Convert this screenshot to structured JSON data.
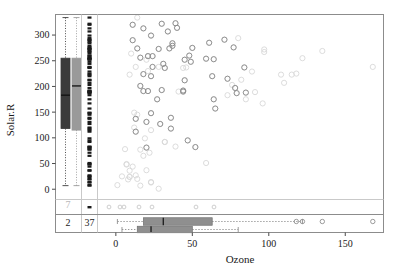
{
  "chart_data": {
    "type": "scatter",
    "title": "",
    "xlabel": "Ozone",
    "ylabel": "Solar.R",
    "xlim": [
      -12,
      175
    ],
    "ylim": [
      -20,
      340
    ],
    "xticks": [
      0,
      50,
      100,
      150
    ],
    "yticks": [
      0,
      50,
      100,
      150,
      200,
      250,
      300
    ],
    "grid": false,
    "legend": null,
    "series": [
      {
        "name": "observed-points",
        "color": "#d8d8d8",
        "marker": "open-circle",
        "points": [
          [
            41,
            190
          ],
          [
            36,
            118
          ],
          [
            12,
            149
          ],
          [
            18,
            313
          ],
          [
            28,
            1
          ],
          [
            23,
            299
          ],
          [
            19,
            99
          ],
          [
            8,
            19
          ],
          [
            16,
            256
          ],
          [
            11,
            290
          ],
          [
            14,
            274
          ],
          [
            18,
            65
          ],
          [
            14,
            334
          ],
          [
            34,
            307
          ],
          [
            6,
            78
          ],
          [
            30,
            322
          ],
          [
            11,
            44
          ],
          [
            1,
            8
          ],
          [
            11,
            320
          ],
          [
            4,
            25
          ],
          [
            32,
            92
          ],
          [
            23,
            13
          ],
          [
            45,
            252
          ],
          [
            115,
            223
          ],
          [
            37,
            279
          ],
          [
            29,
            127
          ],
          [
            71,
            291
          ],
          [
            39,
            323
          ],
          [
            23,
            148
          ],
          [
            21,
            191
          ],
          [
            37,
            284
          ],
          [
            20,
            37
          ],
          [
            12,
            120
          ],
          [
            13,
            137
          ],
          [
            135,
            269
          ],
          [
            49,
            248
          ],
          [
            32,
            236
          ],
          [
            64,
            175
          ],
          [
            40,
            314
          ],
          [
            77,
            276
          ],
          [
            97,
            267
          ],
          [
            97,
            272
          ],
          [
            85,
            175
          ],
          [
            10,
            264
          ],
          [
            27,
            175
          ],
          [
            7,
            48
          ],
          [
            48,
            260
          ],
          [
            35,
            274
          ],
          [
            61,
            285
          ],
          [
            79,
            187
          ],
          [
            63,
            220
          ],
          [
            16,
            7
          ],
          [
            80,
            294
          ],
          [
            108,
            223
          ],
          [
            20,
            81
          ],
          [
            52,
            82
          ],
          [
            82,
            213
          ],
          [
            50,
            275
          ],
          [
            64,
            253
          ],
          [
            59,
            254
          ],
          [
            39,
            83
          ],
          [
            9,
            24
          ],
          [
            16,
            77
          ],
          [
            122,
            255
          ],
          [
            89,
            229
          ],
          [
            110,
            207
          ],
          [
            44,
            192
          ],
          [
            28,
            273
          ],
          [
            65,
            157
          ],
          [
            22,
            71
          ],
          [
            59,
            51
          ],
          [
            23,
            115
          ],
          [
            31,
            244
          ],
          [
            44,
            190
          ],
          [
            21,
            259
          ],
          [
            9,
            36
          ],
          [
            45,
            212
          ],
          [
            168,
            238
          ],
          [
            73,
            215
          ],
          [
            76,
            203
          ],
          [
            118,
            225
          ],
          [
            84,
            237
          ],
          [
            85,
            188
          ],
          [
            96,
            167
          ],
          [
            78,
            197
          ],
          [
            73,
            183
          ],
          [
            91,
            189
          ],
          [
            47,
            95
          ],
          [
            32,
            92
          ],
          [
            20,
            252
          ],
          [
            23,
            220
          ],
          [
            21,
            230
          ],
          [
            24,
            259
          ],
          [
            44,
            236
          ],
          [
            21,
            259
          ],
          [
            28,
            238
          ],
          [
            9,
            24
          ],
          [
            13,
            112
          ],
          [
            46,
            237
          ],
          [
            18,
            224
          ],
          [
            13,
            27
          ],
          [
            24,
            238
          ],
          [
            16,
            201
          ],
          [
            13,
            238
          ],
          [
            23,
            14
          ],
          [
            36,
            139
          ],
          [
            7,
            49
          ],
          [
            14,
            20
          ],
          [
            30,
            193
          ],
          [
            14,
            145
          ],
          [
            18,
            191
          ],
          [
            20,
            131
          ],
          [
            9,
            223
          ]
        ]
      },
      {
        "name": "highlighted-points",
        "color": "#8a8a8a",
        "marker": "open-circle",
        "points": [
          [
            36,
            118
          ],
          [
            18,
            313
          ],
          [
            23,
            299
          ],
          [
            16,
            256
          ],
          [
            11,
            290
          ],
          [
            14,
            274
          ],
          [
            34,
            307
          ],
          [
            30,
            322
          ],
          [
            11,
            320
          ],
          [
            45,
            252
          ],
          [
            37,
            279
          ],
          [
            29,
            127
          ],
          [
            71,
            291
          ],
          [
            39,
            323
          ],
          [
            23,
            148
          ],
          [
            21,
            191
          ],
          [
            37,
            284
          ],
          [
            13,
            137
          ],
          [
            49,
            248
          ],
          [
            32,
            236
          ],
          [
            64,
            175
          ],
          [
            40,
            314
          ],
          [
            77,
            276
          ],
          [
            27,
            175
          ],
          [
            48,
            260
          ],
          [
            35,
            274
          ],
          [
            61,
            285
          ],
          [
            79,
            187
          ],
          [
            63,
            220
          ],
          [
            20,
            81
          ],
          [
            52,
            82
          ],
          [
            50,
            275
          ],
          [
            64,
            253
          ],
          [
            59,
            254
          ],
          [
            44,
            192
          ],
          [
            28,
            273
          ],
          [
            65,
            157
          ],
          [
            31,
            244
          ],
          [
            44,
            190
          ],
          [
            21,
            259
          ],
          [
            45,
            212
          ],
          [
            73,
            215
          ],
          [
            84,
            237
          ],
          [
            85,
            188
          ],
          [
            78,
            197
          ],
          [
            47,
            95
          ],
          [
            23,
            220
          ],
          [
            24,
            259
          ],
          [
            13,
            112
          ],
          [
            18,
            224
          ],
          [
            24,
            238
          ],
          [
            16,
            201
          ],
          [
            36,
            139
          ],
          [
            30,
            193
          ],
          [
            18,
            191
          ],
          [
            20,
            131
          ]
        ]
      }
    ],
    "marginal_boxplots_y": [
      {
        "name": "solar-box-missing-ozone",
        "color": "#3b3b3b",
        "q1": 118,
        "median": 183,
        "q3": 255,
        "whisker_low": 7,
        "whisker_high": 334
      },
      {
        "name": "solar-box-observed",
        "color": "#9a9a9a",
        "q1": 115,
        "median": 201,
        "q3": 255,
        "whisker_low": 7,
        "whisker_high": 334
      }
    ],
    "marginal_boxplots_x": [
      {
        "name": "ozone-box-observed",
        "color": "#8f8f8f",
        "q1": 18,
        "median": 31,
        "q3": 63,
        "whisker_low": 1,
        "whisker_high": 122,
        "outliers": [
          118,
          122,
          135,
          168
        ]
      },
      {
        "name": "ozone-box-missing-solar",
        "color": "#8f8f8f",
        "q1": 14,
        "median": 23,
        "q3": 50,
        "whisker_low": 4,
        "whisker_high": 80,
        "outliers": []
      }
    ],
    "rug_strip_y": {
      "name": "solar-values-with-missing-ozone",
      "color": "#1a1a1a",
      "values": [
        334,
        322,
        320,
        313,
        307,
        299,
        294,
        291,
        290,
        287,
        284,
        279,
        276,
        274,
        273,
        272,
        269,
        267,
        264,
        260,
        259,
        256,
        255,
        254,
        253,
        252,
        248,
        244,
        238,
        237,
        236,
        229,
        225,
        223,
        220,
        213,
        212,
        207,
        203,
        197,
        192,
        191,
        190,
        189,
        188,
        187,
        183,
        175,
        167,
        157,
        149,
        148,
        145,
        139,
        137,
        131,
        127,
        120,
        118,
        115,
        112,
        99,
        95,
        92,
        83,
        82,
        81,
        78,
        77,
        71,
        65,
        51,
        49,
        48,
        44,
        37,
        36,
        27,
        25,
        24,
        20,
        19,
        14,
        13,
        8,
        7
      ]
    },
    "missing_counts": {
      "top_left_cell": "7",
      "bottom_left_cell": "2",
      "bottom_mid_cell": "37"
    }
  },
  "axes": {
    "y_title": "Solar.R",
    "x_title": "Ozone",
    "y_tick_labels": [
      "0",
      "50",
      "100",
      "150",
      "200",
      "250",
      "300"
    ],
    "x_tick_labels": [
      "0",
      "50",
      "100",
      "150"
    ]
  },
  "counts": {
    "missing_y_given_missing_x": "7",
    "missing_both": "2",
    "missing_x_only": "37"
  },
  "colors": {
    "frame": "#8c8c8c",
    "observed_point": "#dcdcdc",
    "highlight_point": "#8a8a8a",
    "box_dark": "#3b3b3b",
    "box_gray": "#9a9a9a",
    "rug": "#1a1a1a",
    "muted_text": "#b9b9b9",
    "text": "#1a1a1a"
  }
}
